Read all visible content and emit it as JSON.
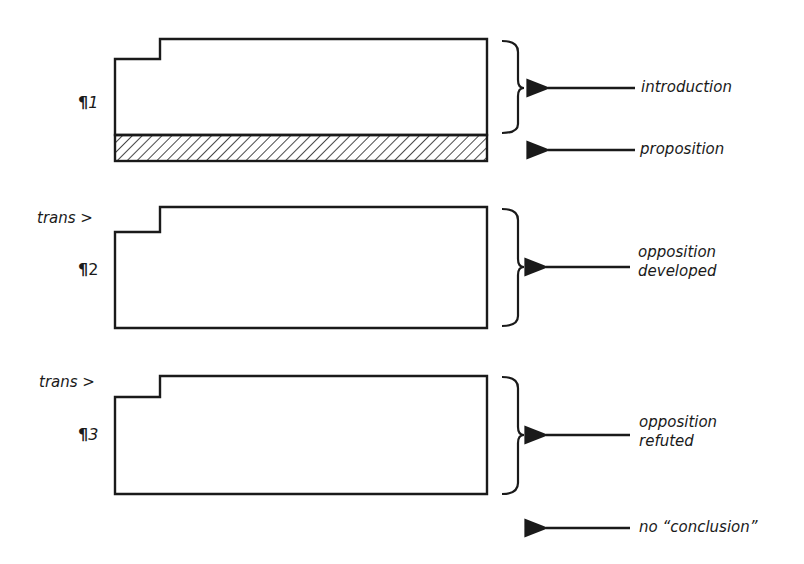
{
  "diagram": {
    "title": "",
    "colors": {
      "ink": "#1a1a1a",
      "background": "#ffffff"
    },
    "paragraphs": [
      {
        "id": "p1",
        "marker": "¶",
        "number": "1",
        "transition_label": "",
        "annotations": [
          {
            "label": "introduction",
            "target": "paragraph body (bracketed)"
          },
          {
            "label": "proposition",
            "target": "hatched final sentence band"
          }
        ],
        "has_hatched_band": true
      },
      {
        "id": "p2",
        "marker": "¶",
        "number": "2",
        "transition_label": "trans >",
        "annotations": [
          {
            "label": "opposition developed",
            "lines": [
              "opposition",
              "developed"
            ],
            "target": "whole paragraph (bracketed)"
          }
        ],
        "has_hatched_band": false
      },
      {
        "id": "p3",
        "marker": "¶",
        "number": "3",
        "transition_label": "trans >",
        "annotations": [
          {
            "label": "opposition refuted",
            "lines": [
              "opposition",
              "refuted"
            ],
            "target": "whole paragraph (bracketed)"
          }
        ],
        "has_hatched_band": false
      }
    ],
    "trailing_annotation": {
      "label": "no “conclusion”"
    }
  }
}
